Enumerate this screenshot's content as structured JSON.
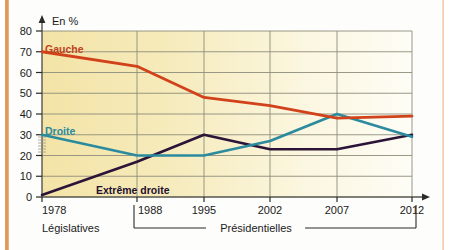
{
  "chart_data": {
    "type": "line",
    "title": "",
    "xlabel": "",
    "ylabel": "En  %",
    "x": [
      1978,
      1988,
      1995,
      2002,
      2007,
      2012
    ],
    "xticklabels": [
      "1978",
      "1988",
      "1995",
      "2002",
      "2007",
      "2012"
    ],
    "yticklabels": [
      "0",
      "10",
      "20",
      "30",
      "40",
      "50",
      "60",
      "70",
      "80"
    ],
    "yticks": [
      0,
      10,
      20,
      30,
      40,
      50,
      60,
      70,
      80
    ],
    "ylim": [
      0,
      80
    ],
    "grid": true,
    "legend_position": "inline-labels",
    "series": [
      {
        "name": "Gauche",
        "color": "#d1421a",
        "values": [
          70,
          63,
          48,
          44,
          38,
          39
        ]
      },
      {
        "name": "Droite",
        "color": "#2b8a9e",
        "values": [
          30,
          20,
          20,
          27,
          40,
          29
        ]
      },
      {
        "name": "Extrême droite",
        "color": "#2b1438",
        "values": [
          1,
          17,
          30,
          23,
          23,
          30
        ]
      }
    ],
    "annotations": [
      {
        "text": "Législatives",
        "role": "period-label",
        "span": [
          1978,
          1978
        ]
      },
      {
        "text": "Présidentielles",
        "role": "period-label",
        "span": [
          1988,
          2012
        ]
      }
    ]
  },
  "axis": {
    "y_title": "En  %",
    "y_ticks": [
      "80",
      "70",
      "60",
      "50",
      "40",
      "30",
      "20",
      "10",
      "0"
    ],
    "x_ticks": [
      "1978",
      "1988",
      "1995",
      "2002",
      "2007",
      "2012"
    ]
  },
  "labels": {
    "gauche": "Gauche",
    "droite": "Droite",
    "extreme_droite": "Extrême droite",
    "legislatives": "Législatives",
    "presidentielles": "Présidentielles"
  },
  "colors": {
    "gauche": "#d1421a",
    "droite": "#2b8a9e",
    "extreme_droite": "#2b1438",
    "plot_bg_left": "#f4e6ae",
    "plot_bg_right": "#fdfcf4",
    "grid": "#8a8a7a",
    "axis": "#55554c",
    "page_edge": "#d98a45"
  }
}
